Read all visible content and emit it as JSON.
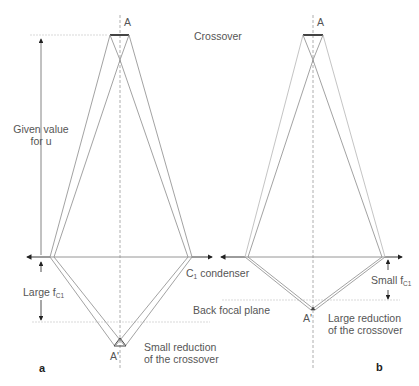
{
  "colors": {
    "ray": "#8a8a8a",
    "ray_light": "#b5b5b5",
    "axis": "#9a9a9a",
    "bar": "#444444",
    "text": "#555555"
  },
  "labels": {
    "crossover": "Crossover",
    "back_focal_plane": "Back focal plane",
    "condenser": "C",
    "condenser_sub": "1",
    "condenser_suffix": " condenser"
  },
  "panel_a": {
    "letter": "a",
    "object_label": "A",
    "image_label": "A'",
    "u_label_line1": "Given value",
    "u_label_line2": "for u",
    "focal_label": "Large f",
    "focal_sub": "C1",
    "reduction_line1": "Small reduction",
    "reduction_line2": "of the crossover"
  },
  "panel_b": {
    "letter": "b",
    "object_label": "A",
    "image_label": "A'",
    "focal_label": "Small f",
    "focal_sub": "C1",
    "reduction_line1": "Large reduction",
    "reduction_line2": "of the crossover"
  }
}
